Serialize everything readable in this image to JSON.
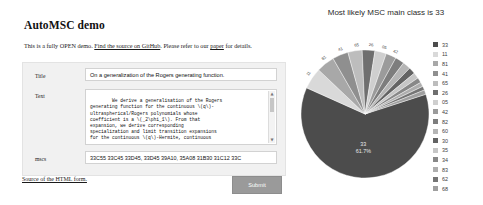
{
  "page": {
    "title": "AutoMSC demo",
    "intro": {
      "before_link1": "This is a fully OPEN demo. ",
      "link1": "Find the source on GitHub",
      "between": ". Please refer to our ",
      "link2": "paper",
      "after": " for details."
    }
  },
  "form": {
    "fields": {
      "title": {
        "label": "Title",
        "value": "On a generalization of the Rogers generating function."
      },
      "text": {
        "label": "Text",
        "value": "We derive a generalisation of the Rogers\ngenerating function for the continuous \\(q\\)-\nultraspherical/Rogers polynomials whose\ncoefficient is a \\(_2\\phi_1\\). From that\nexpansion, we derive corresponding\nspecialization and limit transition expansions\nfor the continuous \\(q\\)-Hermite, continuous"
      },
      "mscs": {
        "label": "mscs",
        "value": "33C55 33C45 33D45, 33D45 39A10, 35A08 31B30 31C12 33C"
      }
    },
    "scrollbar": {
      "up_arrow": "▲",
      "down_arrow": "▼"
    },
    "source_link": "Source of the HTML form.",
    "submit_label": "Submit"
  },
  "chart_data": {
    "type": "pie",
    "title": "Most likely MSC main class is 33",
    "legend_position": "right",
    "main_class": "33",
    "main_label": "33",
    "main_percent_label": "61.7%",
    "categories": [
      "33",
      "11",
      "81",
      "41",
      "65",
      "26",
      "05",
      "42",
      "82",
      "60",
      "30",
      "35",
      "34",
      "83",
      "62",
      "68"
    ],
    "values": [
      61.7,
      5.4,
      4.6,
      4.0,
      3.6,
      3.2,
      2.9,
      2.6,
      2.3,
      2.0,
      1.7,
      1.5,
      1.3,
      1.1,
      1.0,
      1.1
    ],
    "colors": [
      "#4c4c4c",
      "#d9d9d9",
      "#a8a8a8",
      "#8f8f8f",
      "#bdbdbd",
      "#6f6f6f",
      "#cfcfcf",
      "#9b9b9b",
      "#7d7d7d",
      "#b5b5b5",
      "#636363",
      "#c6c6c6",
      "#888888",
      "#aeaeae",
      "#757575",
      "#9f9f9f"
    ],
    "outer_labels": [
      "11",
      "81",
      "41",
      "65",
      "26",
      "05",
      "42"
    ]
  }
}
